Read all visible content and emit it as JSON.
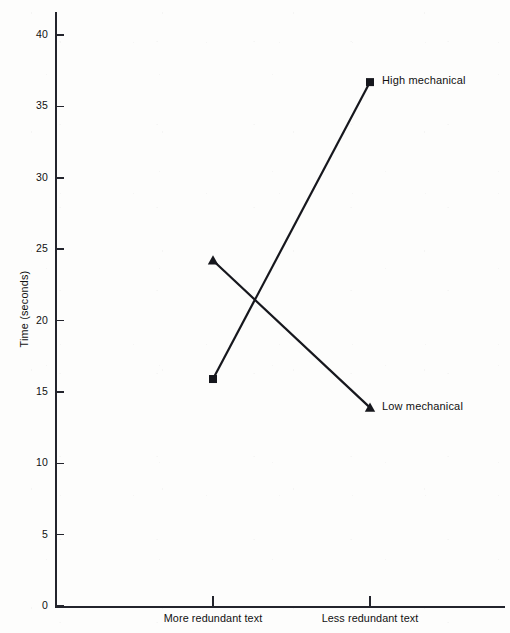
{
  "chart_data": {
    "type": "line",
    "title": "",
    "xlabel": "",
    "ylabel": "Time (seconds)",
    "categories": [
      "More redundant text",
      "Less redundant text"
    ],
    "ylim": [
      0,
      40
    ],
    "yticks": [
      0,
      5,
      10,
      15,
      20,
      25,
      30,
      35,
      40
    ],
    "ytick_labels": [
      "0",
      "5",
      "10",
      "15",
      "20",
      "25",
      "30",
      "35",
      "40"
    ],
    "grid": false,
    "legend_position": "inline-right-of-endpoint",
    "series": [
      {
        "name": "High mechanical",
        "marker": "square",
        "color": "#16171d",
        "values": [
          15.9,
          36.7
        ]
      },
      {
        "name": "Low mechanical",
        "marker": "triangle",
        "color": "#16171d",
        "values": [
          24.2,
          13.9
        ]
      }
    ],
    "annotations": [
      {
        "text": "High mechanical",
        "attached_to": "High mechanical",
        "at_category": "Less redundant text"
      },
      {
        "text": "Low mechanical",
        "attached_to": "Low mechanical",
        "at_category": "Less redundant text"
      }
    ]
  },
  "colors": {
    "axis": "#23242c",
    "ink": "#16171d",
    "background": "#fdfdfc"
  }
}
